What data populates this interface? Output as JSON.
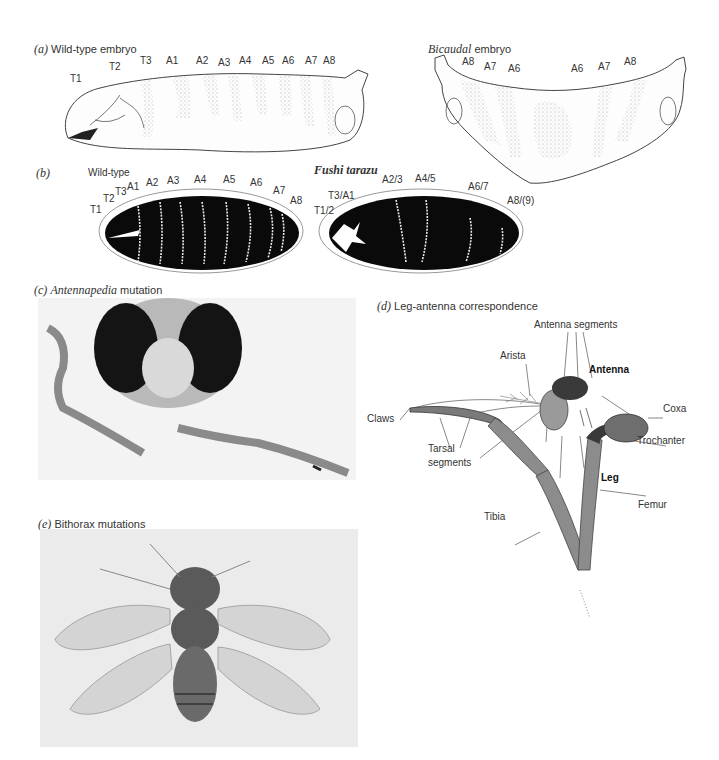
{
  "panel_a": {
    "letter": "(a)",
    "wild_type": {
      "title": "Wild-type embryo",
      "segments": [
        "T1",
        "T2",
        "T3",
        "A1",
        "A2",
        "A3",
        "A4",
        "A5",
        "A6",
        "A7",
        "A8"
      ]
    },
    "bicaudal": {
      "title_italic": "Bicaudal",
      "title_rest": "embryo",
      "segments": [
        "A8",
        "A7",
        "A6",
        "A6",
        "A7",
        "A8"
      ]
    }
  },
  "panel_b": {
    "letter": "(b)",
    "wild_type": {
      "title": "Wild-type",
      "segments": [
        "T1",
        "T2",
        "T3",
        "A1",
        "A2",
        "A3",
        "A4",
        "A5",
        "A6",
        "A7",
        "A8"
      ]
    },
    "fushi_tarazu": {
      "title": "Fushi tarazu",
      "segments": [
        "T1/2",
        "T3/A1",
        "A2/3",
        "A4/5",
        "A6/7",
        "A8/(9)"
      ]
    }
  },
  "panel_c": {
    "letter": "(c)",
    "title_italic": "Antennapedia",
    "title_rest": "mutation"
  },
  "panel_d": {
    "letter": "(d)",
    "title": "Leg-antenna correspondence",
    "labels": {
      "antenna_segments": "Antenna segments",
      "arista": "Arista",
      "antenna": "Antenna",
      "coxa": "Coxa",
      "claws": "Claws",
      "trochanter": "Trochanter",
      "tarsal_1": "Tarsal",
      "tarsal_2": "segments",
      "leg": "Leg",
      "femur": "Femur",
      "tibia": "Tibia"
    },
    "colors": {
      "leg": "#8c8c8c",
      "antenna": "#6e6e6e",
      "dark": "#3a3a3a"
    }
  },
  "panel_e": {
    "letter": "(e)",
    "title": "Bithorax mutations"
  }
}
